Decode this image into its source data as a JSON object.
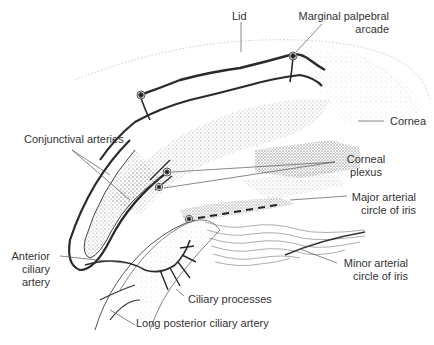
{
  "diagram": {
    "labels": {
      "lid": "Lid",
      "marginal_1": "Marginal palpebral",
      "marginal_2": "arcade",
      "cornea": "Cornea",
      "conjunctival": "Conjunctival arteries",
      "corneal_1": "Corneal",
      "corneal_2": "plexus",
      "major_1": "Major arterial",
      "major_2": "circle of iris",
      "anterior_1": "Anterior",
      "anterior_2": "ciliary",
      "anterior_3": "artery",
      "minor_1": "Minor arterial",
      "minor_2": "circle of iris",
      "ciliary_processes": "Ciliary processes",
      "long_posterior": "Long posterior ciliary artery"
    },
    "colors": {
      "ink": "#2a2a2a",
      "stipple": "#8a8a8a",
      "leader": "#555555",
      "text": "#333333"
    }
  }
}
